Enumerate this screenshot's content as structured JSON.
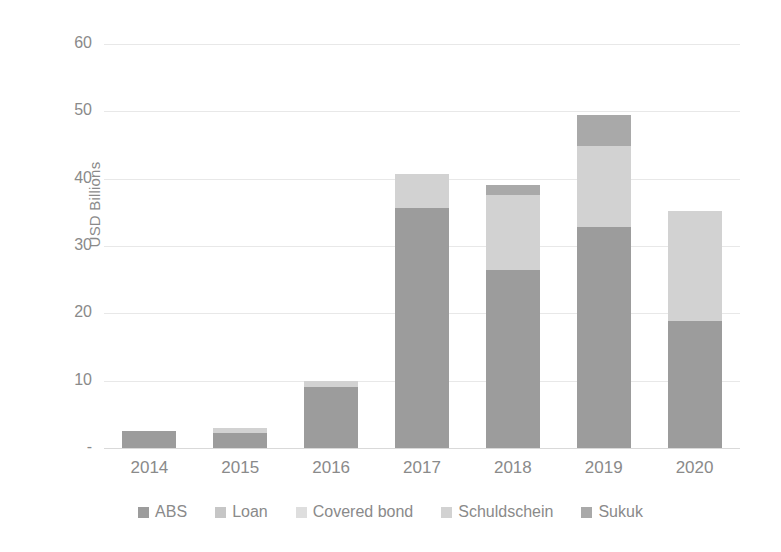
{
  "chart_data": {
    "type": "bar",
    "subtype": "stacked-bar",
    "title": "",
    "xlabel": "",
    "ylabel": "USD Billions",
    "ylim": [
      0,
      60
    ],
    "yticks": [
      0,
      10,
      20,
      30,
      40,
      50,
      60
    ],
    "ytick_labels": [
      "-",
      "10",
      "20",
      "30",
      "40",
      "50",
      "60"
    ],
    "grid": true,
    "legend_position": "bottom",
    "categories": [
      "2014",
      "2015",
      "2016",
      "2017",
      "2018",
      "2019",
      "2020"
    ],
    "series": [
      {
        "name": "ABS",
        "color": "#9c9c9c",
        "values": [
          2.5,
          2.3,
          9.0,
          35.6,
          26.5,
          32.8,
          18.8
        ]
      },
      {
        "name": "Loan",
        "color": "#c6c6c6",
        "values": [
          0.0,
          0.0,
          0.0,
          0.0,
          0.0,
          0.0,
          0.0
        ]
      },
      {
        "name": "Covered bond",
        "color": "#dedede",
        "values": [
          0.0,
          0.0,
          0.0,
          0.0,
          0.0,
          0.0,
          0.0
        ]
      },
      {
        "name": "Schuldschein",
        "color": "#d2d2d2",
        "values": [
          0.0,
          0.7,
          1.0,
          5.1,
          11.1,
          12.1,
          16.4
        ]
      },
      {
        "name": "Sukuk",
        "color": "#a9a9a9",
        "values": [
          0.0,
          0.0,
          0.0,
          0.0,
          1.5,
          4.6,
          0.0
        ]
      }
    ],
    "totals": [
      2.5,
      3.0,
      10.0,
      40.7,
      39.1,
      49.5,
      35.2
    ],
    "bar_colors": {
      "abs": "#9c9c9c",
      "loan": "#c6c6c6",
      "covered_bond": "#dedede",
      "schuldschein": "#d2d2d2",
      "sukuk": "#a9a9a9"
    },
    "axis_color": "#8a8a8a",
    "gridline_color": "#e8e8e8"
  },
  "legend": {
    "items": [
      {
        "label": "ABS",
        "color": "#9c9c9c"
      },
      {
        "label": "Loan",
        "color": "#c6c6c6"
      },
      {
        "label": "Covered bond",
        "color": "#dedede"
      },
      {
        "label": "Schuldschein",
        "color": "#d2d2d2"
      },
      {
        "label": "Sukuk",
        "color": "#a9a9a9"
      }
    ]
  }
}
